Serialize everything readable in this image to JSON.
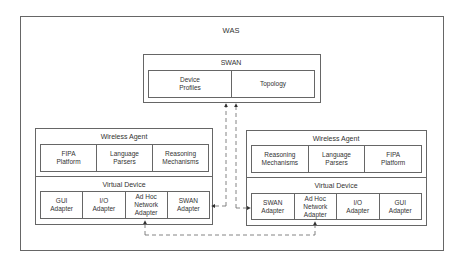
{
  "diagram": {
    "outer": {
      "title": "WAS"
    },
    "swan": {
      "title": "SWAN",
      "cells": [
        "Device\nProfiles",
        "Topology"
      ]
    },
    "left_agent": {
      "wireless_agent": {
        "title": "Wireless Agent",
        "cells": [
          "FIPA\nPlatform",
          "Language\nParsers",
          "Reasoning\nMechanisms"
        ]
      },
      "virtual_device": {
        "title": "Virtual Device",
        "cells": [
          "GUI\nAdapter",
          "I/O\nAdapter",
          "Ad Hoc\nNetwork\nAdapter",
          "SWAN\nAdapter"
        ]
      }
    },
    "right_agent": {
      "wireless_agent": {
        "title": "Wireless Agent",
        "cells": [
          "Reasoning\nMechanisms",
          "Language\nParsers",
          "FIPA\nPlatform"
        ]
      },
      "virtual_device": {
        "title": "Virtual Device",
        "cells": [
          "SWAN\nAdapter",
          "Ad Hoc\nNetwork\nAdapter",
          "I/O\nAdapter",
          "GUI\nAdapter"
        ]
      }
    },
    "connections": [
      {
        "from": "left_agent.virtual_device.SWAN Adapter",
        "to": "swan",
        "style": "dashed",
        "arrow": "both"
      },
      {
        "from": "right_agent.virtual_device.SWAN Adapter",
        "to": "swan",
        "style": "dashed",
        "arrow": "both"
      },
      {
        "from": "left_agent.virtual_device.Ad Hoc Network Adapter",
        "to": "right_agent.virtual_device.Ad Hoc Network Adapter",
        "style": "dashed",
        "arrow": "both"
      }
    ],
    "colors": {
      "line": "#666666",
      "text": "#333333",
      "background": "#ffffff"
    }
  }
}
